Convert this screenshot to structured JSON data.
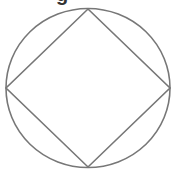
{
  "figure": {
    "partial_text": "g",
    "stroke_color": "#777777",
    "stroke_width": 1.6,
    "circle": {
      "cx": 88,
      "cy": 88,
      "rx": 82,
      "ry": 79.5
    },
    "square_vertices": [
      [
        88,
        9
      ],
      [
        170,
        88
      ],
      [
        88,
        167
      ],
      [
        6,
        88
      ]
    ]
  }
}
